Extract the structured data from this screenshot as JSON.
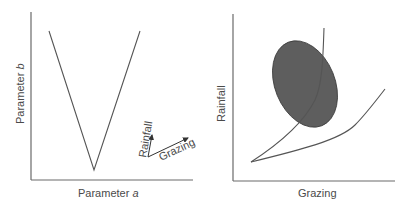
{
  "left_panel": {
    "x_label_prefix": "Parameter ",
    "x_label_var": "a",
    "y_label_prefix": "Parameter ",
    "y_label_var": "b",
    "inset_axes": {
      "vertical_label": "Rainfall",
      "horizontal_label": "Grazing"
    }
  },
  "right_panel": {
    "x_label": "Grazing",
    "y_label": "Rainfall"
  },
  "colors": {
    "axis": "#6a6a6a",
    "curve": "#555555",
    "ellipse_fill": "#5e5e5e",
    "text": "#4a4a4a"
  }
}
